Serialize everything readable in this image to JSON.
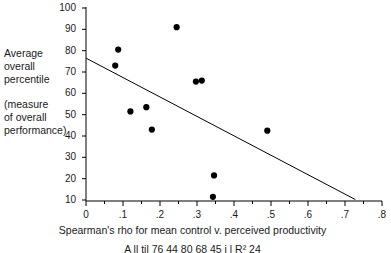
{
  "chart_data": {
    "type": "scatter",
    "title": "",
    "xlabel": "Spearman's rho for mean control v. perceived productivity",
    "ylabel": "Average overall percentile (measure of overall performance)",
    "xlim": [
      0,
      0.8
    ],
    "ylim": [
      10,
      100
    ],
    "xticks": [
      "0",
      ".1",
      ".2",
      ".3",
      ".4",
      ".5",
      ".6",
      ".7",
      ".8"
    ],
    "xtick_values": [
      0,
      0.1,
      0.2,
      0.3,
      0.4,
      0.5,
      0.6,
      0.7,
      0.8
    ],
    "yticks": [
      "100",
      "90",
      "80",
      "70",
      "60",
      "50",
      "40",
      "30",
      "20",
      "10"
    ],
    "ytick_values": [
      100,
      90,
      80,
      70,
      60,
      50,
      40,
      30,
      20,
      10
    ],
    "grid": false,
    "legend": false,
    "marker": "filled-circle",
    "marker_color": "#000000",
    "points": [
      {
        "x": 0.079,
        "y": 73.0
      },
      {
        "x": 0.087,
        "y": 80.5
      },
      {
        "x": 0.12,
        "y": 51.5
      },
      {
        "x": 0.163,
        "y": 53.5
      },
      {
        "x": 0.178,
        "y": 43.0
      },
      {
        "x": 0.245,
        "y": 91.0
      },
      {
        "x": 0.297,
        "y": 65.5
      },
      {
        "x": 0.313,
        "y": 66.0
      },
      {
        "x": 0.343,
        "y": 11.5
      },
      {
        "x": 0.346,
        "y": 21.5
      },
      {
        "x": 0.49,
        "y": 42.5
      }
    ],
    "trendline": {
      "x0": 0.0,
      "y0": 76.5,
      "x1": 0.728,
      "y1": 10.2,
      "color": "#000000"
    }
  },
  "y_axis_caption": {
    "line1": "Average",
    "line2": "overall",
    "line3": "percentile",
    "line4": "(measure",
    "line5": "of overall",
    "line6": "performance)"
  },
  "x_axis_title": "Spearman's rho for mean control v. perceived productivity",
  "footnote": "A                   ll             til        76 44  80 68  45                 i  l     R²      24"
}
